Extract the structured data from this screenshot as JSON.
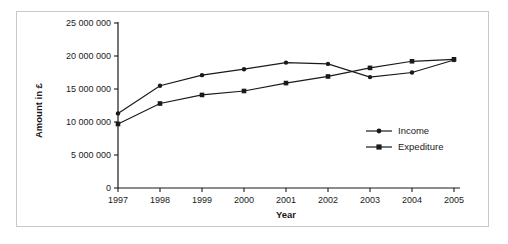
{
  "chart_data": {
    "type": "line",
    "title": "",
    "xlabel": "Year",
    "ylabel": "Amount in £",
    "categories": [
      "1997",
      "1998",
      "1999",
      "2000",
      "2001",
      "2002",
      "2003",
      "2004",
      "2005"
    ],
    "x": [
      1997,
      1998,
      1999,
      2000,
      2001,
      2002,
      2003,
      2004,
      2005
    ],
    "xlim": [
      1997,
      2005
    ],
    "ylim": [
      0,
      25000000
    ],
    "ytick_values": [
      0,
      5000000,
      10000000,
      15000000,
      20000000,
      25000000
    ],
    "ytick_labels": [
      "0",
      "5 000 000",
      "10 000 000",
      "15 000 000",
      "20 000 000",
      "25 000 000"
    ],
    "grid": false,
    "legend_position": "inside-lower-right",
    "series": [
      {
        "name": "Income",
        "marker": "circle",
        "color": "#1a1a1a",
        "values": [
          11300000,
          15500000,
          17100000,
          18000000,
          19000000,
          18800000,
          16800000,
          17500000,
          19400000
        ]
      },
      {
        "name": "Expediture",
        "marker": "square",
        "color": "#1a1a1a",
        "values": [
          9700000,
          12800000,
          14100000,
          14700000,
          15900000,
          16900000,
          18200000,
          19200000,
          19500000
        ]
      }
    ]
  },
  "legend": {
    "items": [
      {
        "label": "Income",
        "marker": "circle"
      },
      {
        "label": "Expediture",
        "marker": "square"
      }
    ]
  },
  "colors": {
    "series": "#1a1a1a",
    "axis": "#1a1a1a",
    "frame": "#c8c8c8",
    "background": "#ffffff"
  }
}
